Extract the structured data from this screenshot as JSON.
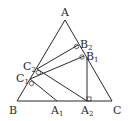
{
  "diagram": {
    "type": "geometry-triangle",
    "points": {
      "A": {
        "label": "A",
        "sub": "",
        "x": 65,
        "y": 20
      },
      "B": {
        "label": "B",
        "sub": "",
        "x": 17,
        "y": 101
      },
      "C": {
        "label": "C",
        "sub": "",
        "x": 112,
        "y": 101
      },
      "A1": {
        "label": "A",
        "sub": "1",
        "x": 57,
        "y": 101
      },
      "A2": {
        "label": "A",
        "sub": "2",
        "x": 87,
        "y": 101
      },
      "B1": {
        "label": "B",
        "sub": "1",
        "x": 84,
        "y": 56
      },
      "B2": {
        "label": "B",
        "sub": "2",
        "x": 78,
        "y": 45
      },
      "C1": {
        "label": "C",
        "sub": "1",
        "x": 30,
        "y": 79
      },
      "C2": {
        "label": "C",
        "sub": "2",
        "x": 37,
        "y": 69
      }
    },
    "segments": [
      [
        "A",
        "B"
      ],
      [
        "B",
        "C"
      ],
      [
        "C",
        "A"
      ],
      [
        "C1",
        "A1"
      ],
      [
        "C2",
        "A2"
      ],
      [
        "C1",
        "B1"
      ],
      [
        "C2",
        "B2"
      ],
      [
        "A2",
        "B1"
      ]
    ],
    "right_angles": [
      "C1",
      "C2",
      "B1",
      "B2",
      "A2"
    ]
  }
}
